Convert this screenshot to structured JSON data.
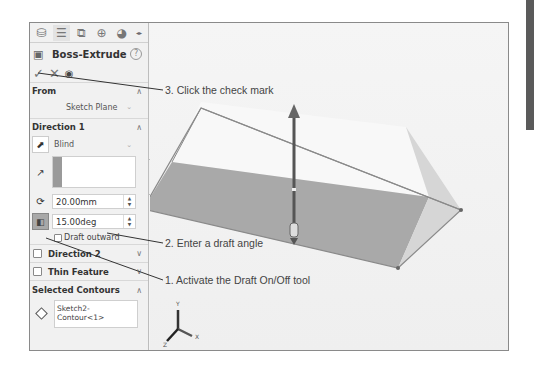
{
  "panel": {
    "tabs": [
      {
        "name": "feature-manager",
        "glyph": "⛁"
      },
      {
        "name": "property-manager",
        "glyph": "☰"
      },
      {
        "name": "configuration-manager",
        "glyph": "⧉"
      },
      {
        "name": "dimxpert-manager",
        "glyph": "⊕"
      },
      {
        "name": "display-manager",
        "glyph": "◕"
      }
    ],
    "title": "Boss-Extrude",
    "help_glyph": "?",
    "actions": {
      "ok_glyph": "✓",
      "cancel_glyph": "✕",
      "preview_glyph": "◉"
    },
    "from": {
      "header": "From",
      "value": "Sketch Plane"
    },
    "direction1": {
      "header": "Direction 1",
      "end_condition": "Blind",
      "depth": "20.00mm",
      "draft_angle": "15.00deg",
      "draft_outward_label": "Draft outward",
      "draft_outward_checked": false,
      "draft_on": true
    },
    "direction2": {
      "label": "Direction 2",
      "checked": false
    },
    "thin_feature": {
      "label": "Thin Feature",
      "checked": false
    },
    "selected_contours": {
      "header": "Selected Contours",
      "items": [
        "Sketch2-Contour<1>"
      ]
    }
  },
  "viewport": {
    "triad": {
      "x_label": "X",
      "y_label": "Y",
      "z_label": "Z"
    }
  },
  "callouts": [
    {
      "id": "3",
      "text": "3. Click the check mark"
    },
    {
      "id": "2",
      "text": "2. Enter a draft angle"
    },
    {
      "id": "1",
      "text": "1. Activate the Draft On/Off tool"
    }
  ],
  "colors": {
    "front_face": "#a9a9a9",
    "top_face": "#f8f8f8",
    "side_face": "#d6d6d6",
    "edge": "#8a8a8a",
    "arrow": "#555555"
  }
}
